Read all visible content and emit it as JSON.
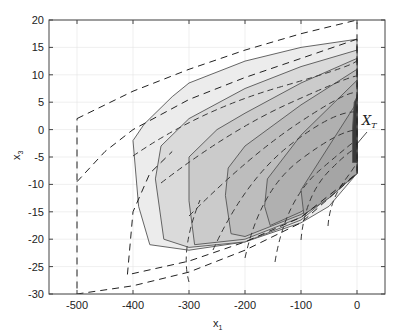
{
  "chart_data": {
    "type": "area",
    "title": "",
    "xlabel": "x1",
    "ylabel": "x3",
    "xlim": [
      -550,
      50
    ],
    "ylim": [
      -30,
      20
    ],
    "xticks": [
      -500,
      -400,
      -300,
      -200,
      -100,
      0
    ],
    "yticks": [
      -30,
      -25,
      -20,
      -15,
      -10,
      -5,
      0,
      5,
      10,
      15,
      20
    ],
    "grid": true,
    "legend": null,
    "annotations": [
      {
        "text": "X_T",
        "x": 15,
        "y": 3,
        "arrow_to": [
          0,
          -2
        ]
      }
    ],
    "series": [
      {
        "name": "outer dashed approximation 1",
        "style": "dashed",
        "points": [
          [
            -500,
            2
          ],
          [
            -400,
            7
          ],
          [
            -300,
            11
          ],
          [
            -200,
            14.5
          ],
          [
            -100,
            17.5
          ],
          [
            0,
            20
          ],
          [
            0,
            -8
          ],
          [
            -100,
            -17
          ],
          [
            -200,
            -22
          ],
          [
            -300,
            -26
          ],
          [
            -400,
            -28.5
          ],
          [
            -500,
            -30
          ],
          [
            -500,
            2
          ]
        ]
      },
      {
        "name": "outer dashed approximation 2",
        "style": "dashed",
        "points": [
          [
            -500,
            -9.5
          ],
          [
            -450,
            -4
          ],
          [
            -400,
            0
          ],
          [
            -300,
            5.5
          ],
          [
            -200,
            9.5
          ],
          [
            -100,
            13
          ],
          [
            0,
            16.5
          ],
          [
            0,
            -8
          ],
          [
            -100,
            -16
          ],
          [
            -200,
            -20.5
          ],
          [
            -300,
            -24
          ],
          [
            -410,
            -26.5
          ],
          [
            -400,
            -15
          ],
          [
            -370,
            -8
          ],
          [
            -330,
            -4
          ]
        ]
      },
      {
        "name": "level set 1 (lightest)",
        "style": "solid",
        "fill": "#ececec",
        "points": [
          [
            -400,
            -2
          ],
          [
            -380,
            1
          ],
          [
            -330,
            6
          ],
          [
            -300,
            8.5
          ],
          [
            -200,
            12.5
          ],
          [
            -100,
            15
          ],
          [
            0,
            16.5
          ],
          [
            0,
            -8
          ],
          [
            -50,
            -14
          ],
          [
            -100,
            -17
          ],
          [
            -200,
            -20.5
          ],
          [
            -300,
            -22
          ],
          [
            -370,
            -21
          ],
          [
            -390,
            -14
          ]
        ]
      },
      {
        "name": "level set 2",
        "style": "solid",
        "fill": "#dadada",
        "points": [
          [
            -350,
            -3
          ],
          [
            -300,
            2
          ],
          [
            -200,
            7.5
          ],
          [
            -100,
            11.5
          ],
          [
            0,
            14.5
          ],
          [
            0,
            -8
          ],
          [
            -100,
            -16.5
          ],
          [
            -200,
            -20.5
          ],
          [
            -300,
            -21.5
          ],
          [
            -345,
            -20
          ],
          [
            -360,
            -9
          ]
        ]
      },
      {
        "name": "level set 3",
        "style": "solid",
        "fill": "#cbcbcb",
        "points": [
          [
            -300,
            -5
          ],
          [
            -250,
            0
          ],
          [
            -200,
            3
          ],
          [
            -100,
            8.5
          ],
          [
            0,
            13
          ],
          [
            0,
            -8
          ],
          [
            -100,
            -16
          ],
          [
            -200,
            -20
          ],
          [
            -290,
            -21
          ],
          [
            -300,
            -13
          ]
        ]
      },
      {
        "name": "level set 4",
        "style": "solid",
        "fill": "#bdbdbd",
        "points": [
          [
            -230,
            -7
          ],
          [
            -200,
            -3
          ],
          [
            -100,
            4.5
          ],
          [
            0,
            11
          ],
          [
            0,
            -8
          ],
          [
            -100,
            -15.5
          ],
          [
            -200,
            -19.5
          ],
          [
            -225,
            -19
          ],
          [
            -235,
            -12
          ]
        ]
      },
      {
        "name": "level set 5",
        "style": "solid",
        "fill": "#b0b0b0",
        "points": [
          [
            -160,
            -9
          ],
          [
            -100,
            -1
          ],
          [
            -50,
            4
          ],
          [
            0,
            9
          ],
          [
            0,
            -8
          ],
          [
            -100,
            -15
          ],
          [
            -155,
            -17.5
          ],
          [
            -165,
            -14
          ]
        ]
      },
      {
        "name": "level set 6",
        "style": "solid",
        "fill": "#a5a5a5",
        "points": [
          [
            -100,
            -11
          ],
          [
            -50,
            -3
          ],
          [
            0,
            5
          ],
          [
            0,
            -8
          ],
          [
            -50,
            -12.5
          ],
          [
            -95,
            -15.5
          ]
        ]
      },
      {
        "name": "target set X_T",
        "style": "solid",
        "fill": "#3a3a3a",
        "points": [
          [
            -5,
            5
          ],
          [
            0,
            6
          ],
          [
            0,
            -6
          ],
          [
            -8,
            -6
          ],
          [
            -8,
            0
          ]
        ]
      }
    ]
  },
  "axes": {
    "x_label": "x",
    "x_label_sub": "1",
    "y_label": "x",
    "y_label_sub": "3",
    "x_tick_labels": [
      "-500",
      "-400",
      "-300",
      "-200",
      "-100",
      "0"
    ],
    "y_tick_labels": [
      "20",
      "15",
      "10",
      "5",
      "0",
      "-5",
      "-10",
      "-15",
      "-20",
      "-25",
      "-30"
    ]
  },
  "annotation": {
    "label_main": "X",
    "label_sub": "T"
  }
}
